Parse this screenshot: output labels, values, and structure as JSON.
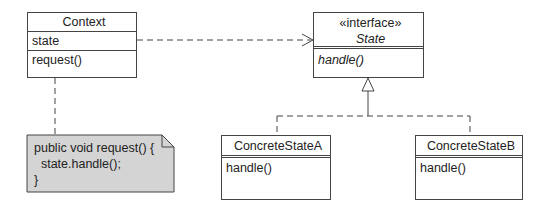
{
  "diagram": {
    "type": "UML class diagram - State pattern",
    "context": {
      "name": "Context",
      "attributes": [
        "state"
      ],
      "operations": [
        "request()"
      ]
    },
    "state": {
      "stereotype": "«interface»",
      "name": "State",
      "operations": [
        "handle()"
      ]
    },
    "concrete_a": {
      "name": "ConcreteStateA",
      "operations": [
        "handle()"
      ]
    },
    "concrete_b": {
      "name": "ConcreteStateB",
      "operations": [
        "handle()"
      ]
    },
    "note": {
      "lines": [
        "public void request() {",
        "  state.handle();",
        "}"
      ]
    },
    "colors": {
      "line": "#444444",
      "note_fill": "#d4d4d4",
      "background": "#ffffff"
    }
  }
}
